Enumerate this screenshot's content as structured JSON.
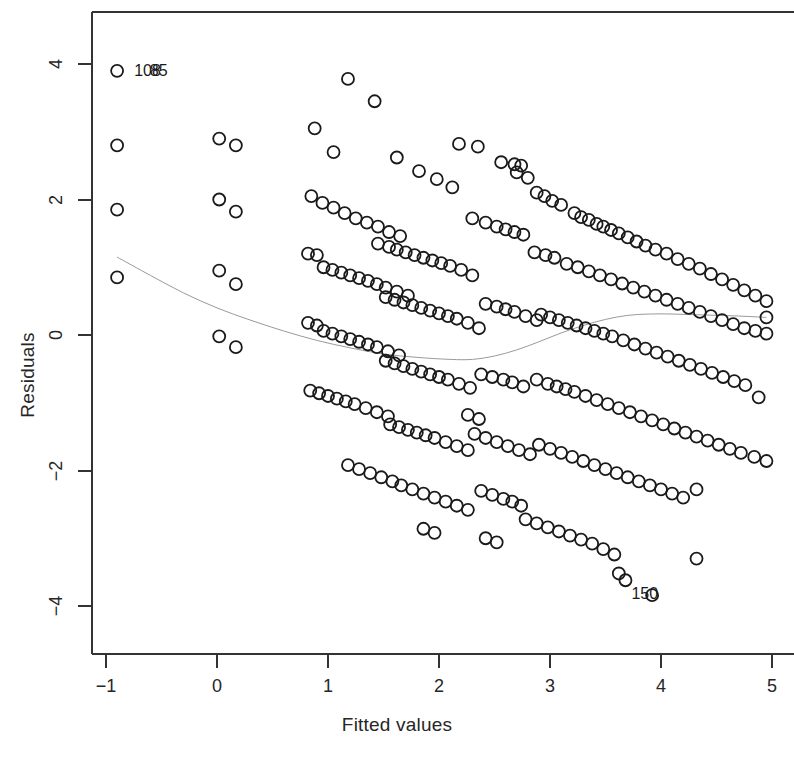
{
  "chart_data": {
    "type": "scatter",
    "title": "",
    "xlabel": "Fitted values",
    "ylabel": "Residuals",
    "xlim": [
      -1.35,
      5.25
    ],
    "ylim": [
      -4.75,
      4.75
    ],
    "xticks": [
      -1,
      0,
      1,
      2,
      3,
      4,
      5
    ],
    "xticklabels": [
      "−1",
      "0",
      "1",
      "2",
      "3",
      "4",
      "5"
    ],
    "yticks": [
      4,
      2,
      0,
      -2,
      -4
    ],
    "yticklabels": [
      "4",
      "2",
      "0",
      "−2",
      "−4"
    ],
    "grid": false,
    "legend": null,
    "marker": "open-circle",
    "marker_color": "#1a1a1a",
    "marker_size": 6,
    "smoother": {
      "name": "lowess",
      "color": "#9a9a9a",
      "width": 1,
      "x": [
        -0.9,
        -0.6,
        -0.3,
        0.0,
        0.3,
        0.6,
        0.9,
        1.2,
        1.5,
        1.8,
        2.1,
        2.3,
        2.5,
        2.7,
        2.9,
        3.1,
        3.3,
        3.5,
        3.7,
        3.9,
        4.1,
        4.3,
        4.5,
        4.7,
        4.95
      ],
      "y": [
        1.15,
        0.88,
        0.62,
        0.4,
        0.22,
        0.06,
        -0.08,
        -0.19,
        -0.28,
        -0.33,
        -0.36,
        -0.36,
        -0.31,
        -0.22,
        -0.1,
        0.03,
        0.14,
        0.23,
        0.29,
        0.31,
        0.31,
        0.3,
        0.29,
        0.28,
        0.26
      ]
    },
    "annotations": [
      {
        "text": "108",
        "x": -0.8,
        "y": 3.9,
        "align": "left"
      },
      {
        "text": "85",
        "x": -0.66,
        "y": 3.9,
        "align": "left"
      },
      {
        "text": "150",
        "x": 3.68,
        "y": -3.83,
        "align": "left"
      }
    ],
    "bands_note": "Residuals fall on parallel downward-sloping bands, characteristic of an integer-valued (count) response.",
    "bands": [
      {
        "offset": 4.8,
        "x_start": -0.9,
        "x_end": -0.9,
        "count": 1
      },
      {
        "offset": 3.72,
        "x_start": 1.18,
        "x_end": 1.18,
        "count": 1
      },
      {
        "offset": 3.45,
        "x_start": 1.42,
        "x_end": 1.42,
        "count": 1
      },
      {
        "offset": 3.9,
        "x_start": 0.02,
        "x_end": 0.17,
        "count": 2
      }
    ],
    "points": [
      [
        -0.9,
        3.9
      ],
      [
        -0.9,
        2.8
      ],
      [
        -0.9,
        1.85
      ],
      [
        -0.9,
        0.85
      ],
      [
        0.02,
        2.9
      ],
      [
        0.17,
        2.8
      ],
      [
        0.02,
        2.0
      ],
      [
        0.17,
        1.82
      ],
      [
        0.02,
        0.95
      ],
      [
        0.17,
        0.75
      ],
      [
        0.02,
        -0.02
      ],
      [
        0.17,
        -0.18
      ],
      [
        0.88,
        3.05
      ],
      [
        1.05,
        2.7
      ],
      [
        1.18,
        3.78
      ],
      [
        1.42,
        3.45
      ],
      [
        1.62,
        2.62
      ],
      [
        1.82,
        2.42
      ],
      [
        1.98,
        2.3
      ],
      [
        2.12,
        2.18
      ],
      [
        2.35,
        2.78
      ],
      [
        2.56,
        2.55
      ],
      [
        2.68,
        2.52
      ],
      [
        2.74,
        2.5
      ],
      [
        2.88,
        2.1
      ],
      [
        2.95,
        2.05
      ],
      [
        3.02,
        1.98
      ],
      [
        3.1,
        1.92
      ],
      [
        3.22,
        1.8
      ],
      [
        3.28,
        1.74
      ],
      [
        3.35,
        1.7
      ],
      [
        3.42,
        1.64
      ],
      [
        3.48,
        1.6
      ],
      [
        3.55,
        1.55
      ],
      [
        3.62,
        1.5
      ],
      [
        3.7,
        1.44
      ],
      [
        3.78,
        1.38
      ],
      [
        3.86,
        1.32
      ],
      [
        3.95,
        1.26
      ],
      [
        4.05,
        1.2
      ],
      [
        4.15,
        1.12
      ],
      [
        4.25,
        1.05
      ],
      [
        4.35,
        0.98
      ],
      [
        4.45,
        0.9
      ],
      [
        4.55,
        0.82
      ],
      [
        4.65,
        0.74
      ],
      [
        4.75,
        0.66
      ],
      [
        4.85,
        0.58
      ],
      [
        4.95,
        0.5
      ],
      [
        0.85,
        2.05
      ],
      [
        0.95,
        1.95
      ],
      [
        1.05,
        1.88
      ],
      [
        1.15,
        1.8
      ],
      [
        1.25,
        1.72
      ],
      [
        1.35,
        1.66
      ],
      [
        1.45,
        1.6
      ],
      [
        1.55,
        1.52
      ],
      [
        1.65,
        1.46
      ],
      [
        1.45,
        1.35
      ],
      [
        1.55,
        1.3
      ],
      [
        1.62,
        1.26
      ],
      [
        1.7,
        1.22
      ],
      [
        1.78,
        1.18
      ],
      [
        1.86,
        1.14
      ],
      [
        1.94,
        1.1
      ],
      [
        2.02,
        1.06
      ],
      [
        2.1,
        1.02
      ],
      [
        2.2,
        0.96
      ],
      [
        2.3,
        0.88
      ],
      [
        2.3,
        1.72
      ],
      [
        2.42,
        1.66
      ],
      [
        2.52,
        1.6
      ],
      [
        2.6,
        1.56
      ],
      [
        2.68,
        1.52
      ],
      [
        2.76,
        1.48
      ],
      [
        2.86,
        1.22
      ],
      [
        2.96,
        1.18
      ],
      [
        3.04,
        1.14
      ],
      [
        3.15,
        1.05
      ],
      [
        3.25,
        1.0
      ],
      [
        3.35,
        0.94
      ],
      [
        3.45,
        0.88
      ],
      [
        3.55,
        0.82
      ],
      [
        3.65,
        0.76
      ],
      [
        3.75,
        0.7
      ],
      [
        3.85,
        0.64
      ],
      [
        3.95,
        0.58
      ],
      [
        4.05,
        0.52
      ],
      [
        4.15,
        0.46
      ],
      [
        4.25,
        0.4
      ],
      [
        4.35,
        0.34
      ],
      [
        4.45,
        0.28
      ],
      [
        4.55,
        0.22
      ],
      [
        4.65,
        0.16
      ],
      [
        4.75,
        0.1
      ],
      [
        4.85,
        0.06
      ],
      [
        4.95,
        0.02
      ],
      [
        0.82,
        1.2
      ],
      [
        0.9,
        1.18
      ],
      [
        0.96,
        1.0
      ],
      [
        1.04,
        0.96
      ],
      [
        1.12,
        0.92
      ],
      [
        1.2,
        0.88
      ],
      [
        1.28,
        0.84
      ],
      [
        1.36,
        0.8
      ],
      [
        1.44,
        0.75
      ],
      [
        1.52,
        0.7
      ],
      [
        1.62,
        0.64
      ],
      [
        1.72,
        0.58
      ],
      [
        1.52,
        0.56
      ],
      [
        1.6,
        0.52
      ],
      [
        1.68,
        0.48
      ],
      [
        1.76,
        0.44
      ],
      [
        1.84,
        0.4
      ],
      [
        1.92,
        0.36
      ],
      [
        2.0,
        0.32
      ],
      [
        2.08,
        0.28
      ],
      [
        2.16,
        0.24
      ],
      [
        2.26,
        0.18
      ],
      [
        2.36,
        0.1
      ],
      [
        2.42,
        0.46
      ],
      [
        2.52,
        0.42
      ],
      [
        2.6,
        0.38
      ],
      [
        2.68,
        0.34
      ],
      [
        2.78,
        0.28
      ],
      [
        2.88,
        0.22
      ],
      [
        2.92,
        0.3
      ],
      [
        3.0,
        0.26
      ],
      [
        3.08,
        0.22
      ],
      [
        3.16,
        0.18
      ],
      [
        3.24,
        0.14
      ],
      [
        3.32,
        0.1
      ],
      [
        3.4,
        0.06
      ],
      [
        3.48,
        0.02
      ],
      [
        3.56,
        -0.02
      ],
      [
        3.66,
        -0.08
      ],
      [
        3.76,
        -0.14
      ],
      [
        3.86,
        -0.2
      ],
      [
        3.96,
        -0.26
      ],
      [
        4.06,
        -0.32
      ],
      [
        4.16,
        -0.38
      ],
      [
        4.26,
        -0.44
      ],
      [
        4.36,
        -0.5
      ],
      [
        4.46,
        -0.56
      ],
      [
        4.56,
        -0.62
      ],
      [
        4.66,
        -0.68
      ],
      [
        4.76,
        -0.74
      ],
      [
        0.82,
        0.18
      ],
      [
        0.9,
        0.14
      ],
      [
        0.96,
        0.06
      ],
      [
        1.04,
        0.02
      ],
      [
        1.12,
        -0.02
      ],
      [
        1.2,
        -0.06
      ],
      [
        1.28,
        -0.1
      ],
      [
        1.36,
        -0.14
      ],
      [
        1.44,
        -0.18
      ],
      [
        1.54,
        -0.24
      ],
      [
        1.64,
        -0.3
      ],
      [
        1.52,
        -0.38
      ],
      [
        1.6,
        -0.42
      ],
      [
        1.68,
        -0.46
      ],
      [
        1.76,
        -0.5
      ],
      [
        1.84,
        -0.54
      ],
      [
        1.92,
        -0.58
      ],
      [
        2.0,
        -0.62
      ],
      [
        2.08,
        -0.66
      ],
      [
        2.18,
        -0.72
      ],
      [
        2.28,
        -0.78
      ],
      [
        2.38,
        -0.58
      ],
      [
        2.48,
        -0.62
      ],
      [
        2.58,
        -0.66
      ],
      [
        2.66,
        -0.7
      ],
      [
        2.76,
        -0.76
      ],
      [
        2.88,
        -0.66
      ],
      [
        2.98,
        -0.72
      ],
      [
        3.06,
        -0.76
      ],
      [
        3.14,
        -0.8
      ],
      [
        3.22,
        -0.84
      ],
      [
        3.32,
        -0.9
      ],
      [
        3.42,
        -0.96
      ],
      [
        3.52,
        -1.02
      ],
      [
        3.62,
        -1.08
      ],
      [
        3.72,
        -1.14
      ],
      [
        3.82,
        -1.2
      ],
      [
        3.92,
        -1.26
      ],
      [
        4.02,
        -1.32
      ],
      [
        4.12,
        -1.38
      ],
      [
        4.22,
        -1.44
      ],
      [
        4.32,
        -1.5
      ],
      [
        4.42,
        -1.56
      ],
      [
        4.52,
        -1.62
      ],
      [
        4.62,
        -1.68
      ],
      [
        4.72,
        -1.74
      ],
      [
        4.84,
        -1.8
      ],
      [
        4.95,
        -1.86
      ],
      [
        0.84,
        -0.82
      ],
      [
        0.92,
        -0.86
      ],
      [
        1.0,
        -0.9
      ],
      [
        1.08,
        -0.94
      ],
      [
        1.16,
        -0.98
      ],
      [
        1.24,
        -1.02
      ],
      [
        1.34,
        -1.08
      ],
      [
        1.44,
        -1.14
      ],
      [
        1.54,
        -1.2
      ],
      [
        1.56,
        -1.32
      ],
      [
        1.64,
        -1.36
      ],
      [
        1.72,
        -1.4
      ],
      [
        1.8,
        -1.44
      ],
      [
        1.88,
        -1.48
      ],
      [
        1.96,
        -1.52
      ],
      [
        2.06,
        -1.58
      ],
      [
        2.16,
        -1.64
      ],
      [
        2.26,
        -1.7
      ],
      [
        2.32,
        -1.46
      ],
      [
        2.42,
        -1.52
      ],
      [
        2.52,
        -1.58
      ],
      [
        2.62,
        -1.64
      ],
      [
        2.72,
        -1.7
      ],
      [
        2.82,
        -1.76
      ],
      [
        2.9,
        -1.62
      ],
      [
        3.0,
        -1.68
      ],
      [
        3.1,
        -1.74
      ],
      [
        3.2,
        -1.8
      ],
      [
        3.3,
        -1.86
      ],
      [
        3.4,
        -1.92
      ],
      [
        3.5,
        -1.98
      ],
      [
        3.6,
        -2.04
      ],
      [
        3.7,
        -2.1
      ],
      [
        3.8,
        -2.16
      ],
      [
        3.9,
        -2.22
      ],
      [
        4.0,
        -2.28
      ],
      [
        4.1,
        -2.34
      ],
      [
        4.2,
        -2.4
      ],
      [
        4.32,
        -2.28
      ],
      [
        1.18,
        -1.92
      ],
      [
        1.28,
        -1.98
      ],
      [
        1.38,
        -2.04
      ],
      [
        1.48,
        -2.1
      ],
      [
        1.58,
        -2.16
      ],
      [
        1.66,
        -2.22
      ],
      [
        1.76,
        -2.28
      ],
      [
        1.86,
        -2.34
      ],
      [
        1.96,
        -2.4
      ],
      [
        2.06,
        -2.46
      ],
      [
        2.16,
        -2.52
      ],
      [
        2.26,
        -2.58
      ],
      [
        2.38,
        -2.3
      ],
      [
        2.48,
        -2.36
      ],
      [
        2.58,
        -2.42
      ],
      [
        2.66,
        -2.46
      ],
      [
        2.74,
        -2.52
      ],
      [
        2.78,
        -2.72
      ],
      [
        2.88,
        -2.78
      ],
      [
        2.98,
        -2.84
      ],
      [
        3.08,
        -2.9
      ],
      [
        3.18,
        -2.96
      ],
      [
        3.28,
        -3.02
      ],
      [
        3.38,
        -3.08
      ],
      [
        3.48,
        -3.16
      ],
      [
        3.58,
        -3.24
      ],
      [
        3.62,
        -3.52
      ],
      [
        3.68,
        -3.62
      ],
      [
        3.92,
        -3.84
      ],
      [
        4.32,
        -3.3
      ],
      [
        1.86,
        -2.86
      ],
      [
        1.96,
        -2.92
      ],
      [
        2.42,
        -3.0
      ],
      [
        2.52,
        -3.06
      ],
      [
        2.26,
        -1.18
      ],
      [
        2.36,
        -1.24
      ],
      [
        4.88,
        -0.92
      ],
      [
        4.95,
        0.26
      ],
      [
        2.8,
        2.32
      ],
      [
        2.7,
        2.4
      ],
      [
        2.18,
        2.82
      ]
    ]
  }
}
